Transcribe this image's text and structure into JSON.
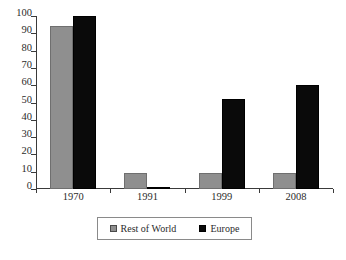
{
  "chart_data": {
    "type": "bar",
    "title": "",
    "xlabel": "",
    "ylabel": "",
    "categories": [
      "1970",
      "1991",
      "1999",
      "2008"
    ],
    "series": [
      {
        "name": "Rest of World",
        "color": "#8f8f8f",
        "values": [
          94,
          9,
          9,
          9
        ]
      },
      {
        "name": "Europe",
        "color": "#0a0a0a",
        "values": [
          100,
          1,
          52,
          60
        ]
      }
    ],
    "ylim": [
      0,
      100
    ],
    "yticks": [
      0,
      10,
      20,
      30,
      40,
      50,
      60,
      70,
      80,
      90,
      100
    ],
    "ytick_labels": [
      "0",
      "10",
      "20",
      "30",
      "40",
      "50",
      "60",
      "70",
      "80",
      "90",
      "100"
    ],
    "grid": false,
    "legend_position": "bottom"
  },
  "legend": {
    "entries": [
      {
        "label": "Rest of World",
        "marker": "gray-square-swatch"
      },
      {
        "label": "Europe",
        "marker": "black-square-swatch"
      }
    ]
  }
}
